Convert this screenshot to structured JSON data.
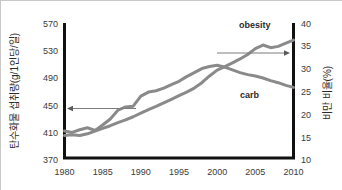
{
  "chart_data": {
    "type": "line",
    "title": "",
    "subtitle": "",
    "xlabel": "",
    "ylabel": "탄수화물 섭취량(g/1인당/일)",
    "y2label": "비만 비율(%)",
    "xlim": [
      1980,
      2010
    ],
    "ylim": [
      370,
      570
    ],
    "y2lim": [
      10,
      40
    ],
    "grid": false,
    "legend_position": "inline-annotation",
    "x_ticks": [
      "1980",
      "1985",
      "1990",
      "1995",
      "2000",
      "2005",
      "2010"
    ],
    "y_ticks": [
      "370",
      "410",
      "450",
      "490",
      "530",
      "570"
    ],
    "y2_ticks": [
      "10",
      "15",
      "20",
      "25",
      "30",
      "35",
      "40"
    ],
    "x": [
      1980,
      1981,
      1982,
      1983,
      1984,
      1985,
      1986,
      1987,
      1988,
      1989,
      1990,
      1991,
      1992,
      1993,
      1994,
      1995,
      1996,
      1997,
      1998,
      1999,
      2000,
      2001,
      2002,
      2003,
      2004,
      2005,
      2006,
      2007,
      2008,
      2009,
      2010
    ],
    "series": [
      {
        "name": "carb",
        "label": "carb",
        "axis": "left",
        "units": "g/person/day",
        "color": "#8a8a8a",
        "values": [
          410,
          408,
          412,
          415,
          411,
          419,
          428,
          441,
          446,
          447,
          462,
          468,
          470,
          474,
          479,
          484,
          491,
          497,
          503,
          506,
          508,
          505,
          501,
          497,
          494,
          492,
          489,
          485,
          482,
          478,
          475
        ]
      },
      {
        "name": "obesity",
        "label": "obesity",
        "axis": "right",
        "units": "%",
        "color": "#8a8a8a",
        "values": [
          15.0,
          15.2,
          15.0,
          15.4,
          16.0,
          16.6,
          17.2,
          17.9,
          18.5,
          19.2,
          20.0,
          20.8,
          21.5,
          22.3,
          23.1,
          23.9,
          24.7,
          25.6,
          26.8,
          28.3,
          29.6,
          30.4,
          31.2,
          32.1,
          33.1,
          34.4,
          35.2,
          34.6,
          34.9,
          35.6,
          36.3
        ]
      }
    ],
    "annotations": [
      {
        "name": "carb-axis-arrow",
        "direction": "left",
        "points_to": "left-axis",
        "at_value": 450
      },
      {
        "name": "obesity-axis-arrow",
        "direction": "right",
        "points_to": "right-axis",
        "at_value": 33
      }
    ]
  },
  "colors": {
    "line": "#8a8a8a",
    "axis": "#111111",
    "text": "#2b2b2b",
    "background": "#ffffff",
    "border": "#c8c8c8"
  }
}
